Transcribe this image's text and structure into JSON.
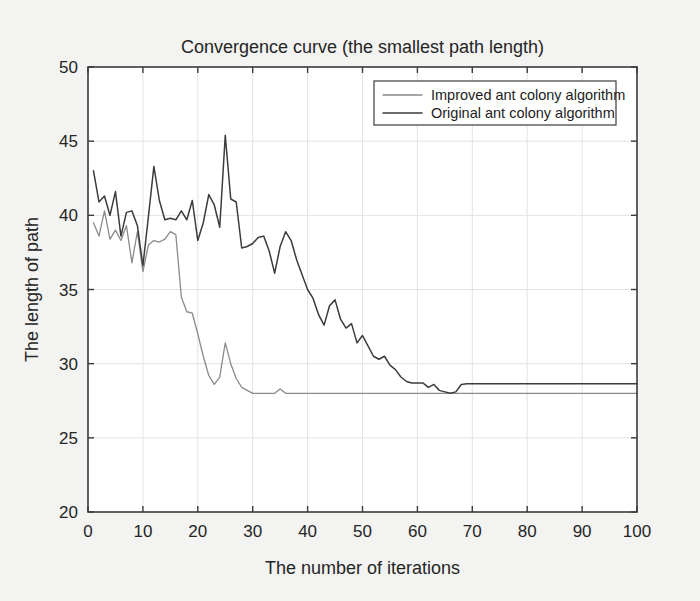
{
  "chart_data": {
    "type": "line",
    "title": "Convergence curve (the smallest path length)",
    "xlabel": "The number of iterations",
    "ylabel": "The length of path",
    "xlim": [
      0,
      100
    ],
    "ylim": [
      20,
      50
    ],
    "xticks": [
      0,
      10,
      20,
      30,
      40,
      50,
      60,
      70,
      80,
      90,
      100
    ],
    "yticks": [
      20,
      25,
      30,
      35,
      40,
      45,
      50
    ],
    "grid": true,
    "legend_position": "top-right",
    "colors": {
      "improved": "#8a8a8a",
      "original": "#3c3c3c",
      "grid": "#e3e3e3",
      "axis": "#3a3a3a",
      "plot_background": "#ffffff",
      "figure_background": "#f3f3f1"
    },
    "x": [
      1,
      2,
      3,
      4,
      5,
      6,
      7,
      8,
      9,
      10,
      11,
      12,
      13,
      14,
      15,
      16,
      17,
      18,
      19,
      20,
      21,
      22,
      23,
      24,
      25,
      26,
      27,
      28,
      29,
      30,
      31,
      32,
      33,
      34,
      35,
      36,
      37,
      38,
      39,
      40,
      41,
      42,
      43,
      44,
      45,
      46,
      47,
      48,
      49,
      50,
      51,
      52,
      53,
      54,
      55,
      56,
      57,
      58,
      59,
      60,
      61,
      62,
      63,
      64,
      65,
      66,
      67,
      68,
      69,
      70,
      71,
      72,
      73,
      74,
      75,
      76,
      77,
      78,
      79,
      80,
      81,
      82,
      83,
      84,
      85,
      86,
      87,
      88,
      89,
      90,
      91,
      92,
      93,
      94,
      95,
      96,
      97,
      98,
      99,
      100
    ],
    "series": [
      {
        "name": "Improved ant colony algorithm",
        "color": "#8a8a8a",
        "values": [
          39.5,
          38.6,
          40.3,
          38.4,
          39.0,
          38.3,
          39.3,
          36.8,
          38.9,
          36.2,
          38.0,
          38.3,
          38.2,
          38.4,
          38.9,
          38.7,
          34.5,
          33.5,
          33.4,
          32.0,
          30.5,
          29.2,
          28.6,
          29.1,
          31.4,
          30.0,
          29.0,
          28.4,
          28.2,
          28.0,
          28.0,
          28.0,
          28.0,
          28.0,
          28.3,
          28.0,
          28.0,
          28.0,
          28.0,
          28.0,
          28.0,
          28.0,
          28.0,
          28.0,
          28.0,
          28.0,
          28.0,
          28.0,
          28.0,
          28.0,
          28.0,
          28.0,
          28.0,
          28.0,
          28.0,
          28.0,
          28.0,
          28.0,
          28.0,
          28.0,
          28.0,
          28.0,
          28.0,
          28.0,
          28.0,
          28.0,
          28.0,
          28.0,
          28.0,
          28.0,
          28.0,
          28.0,
          28.0,
          28.0,
          28.0,
          28.0,
          28.0,
          28.0,
          28.0,
          28.0,
          28.0,
          28.0,
          28.0,
          28.0,
          28.0,
          28.0,
          28.0,
          28.0,
          28.0,
          28.0,
          28.0,
          28.0,
          28.0,
          28.0,
          28.0,
          28.0,
          28.0,
          28.0,
          28.0,
          28.0
        ]
      },
      {
        "name": "Original ant colony algorithm",
        "color": "#3c3c3c",
        "values": [
          43.0,
          40.9,
          41.3,
          40.0,
          41.6,
          38.6,
          40.2,
          40.3,
          39.3,
          36.6,
          39.9,
          43.3,
          41.0,
          39.7,
          39.8,
          39.7,
          40.3,
          39.7,
          41.0,
          38.3,
          39.5,
          41.4,
          40.7,
          39.2,
          45.4,
          41.1,
          40.9,
          37.8,
          37.9,
          38.1,
          38.5,
          38.6,
          37.6,
          36.1,
          37.9,
          38.9,
          38.3,
          37.0,
          36.0,
          35.0,
          34.4,
          33.3,
          32.6,
          33.9,
          34.3,
          33.0,
          32.4,
          32.7,
          31.4,
          31.9,
          31.2,
          30.5,
          30.3,
          30.5,
          29.9,
          29.6,
          29.1,
          28.8,
          28.7,
          28.7,
          28.7,
          28.4,
          28.6,
          28.2,
          28.1,
          28.0,
          28.1,
          28.6,
          28.65,
          28.65,
          28.65,
          28.65,
          28.65,
          28.65,
          28.65,
          28.65,
          28.65,
          28.65,
          28.65,
          28.65,
          28.65,
          28.65,
          28.65,
          28.65,
          28.65,
          28.65,
          28.65,
          28.65,
          28.65,
          28.65,
          28.65,
          28.65,
          28.65,
          28.65,
          28.65,
          28.65,
          28.65,
          28.65,
          28.65,
          28.65
        ]
      }
    ]
  }
}
